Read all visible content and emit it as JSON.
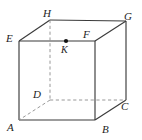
{
  "figure": {
    "type": "geometry-diagram",
    "shape": "cube",
    "width": 142,
    "height": 140,
    "background_color": "#ffffff",
    "solid_edge_color": "#3b3b3b",
    "hidden_edge_color": "#8c8c8c",
    "label_color": "#1d1d1d",
    "point_color": "#111111"
  },
  "vertices": [
    {
      "id": "A",
      "label": "A",
      "x": 19,
      "y": 120,
      "label_x": 7,
      "label_y": 122,
      "hidden": false
    },
    {
      "id": "B",
      "label": "B",
      "x": 95,
      "y": 120,
      "label_x": 102,
      "label_y": 124,
      "hidden": false
    },
    {
      "id": "C",
      "label": "C",
      "x": 126,
      "y": 100,
      "label_x": 121,
      "label_y": 101,
      "hidden": false
    },
    {
      "id": "D",
      "label": "D",
      "x": 50,
      "y": 100,
      "label_x": 33,
      "label_y": 89,
      "hidden": true
    },
    {
      "id": "E",
      "label": "E",
      "x": 19,
      "y": 41,
      "label_x": 6,
      "label_y": 33,
      "hidden": false
    },
    {
      "id": "F",
      "label": "F",
      "x": 95,
      "y": 41,
      "label_x": 83,
      "label_y": 29,
      "hidden": false
    },
    {
      "id": "G",
      "label": "G",
      "x": 126,
      "y": 21,
      "label_x": 124,
      "label_y": 11,
      "hidden": false
    },
    {
      "id": "H",
      "label": "H",
      "x": 50,
      "y": 20,
      "label_x": 43,
      "label_y": 8,
      "hidden": false
    }
  ],
  "marked_points": [
    {
      "id": "K",
      "label": "K",
      "x": 66,
      "y": 41,
      "radius": 2.1,
      "label_x": 61,
      "label_y": 45,
      "on_edge": "EF"
    }
  ],
  "edges": {
    "solid": [
      {
        "from": "A",
        "to": "B"
      },
      {
        "from": "B",
        "to": "F"
      },
      {
        "from": "F",
        "to": "E"
      },
      {
        "from": "E",
        "to": "A"
      },
      {
        "from": "E",
        "to": "H"
      },
      {
        "from": "F",
        "to": "G"
      },
      {
        "from": "H",
        "to": "G"
      },
      {
        "from": "G",
        "to": "C"
      },
      {
        "from": "B",
        "to": "C"
      }
    ],
    "dashed": [
      {
        "from": "H",
        "to": "D"
      },
      {
        "from": "D",
        "to": "A"
      },
      {
        "from": "D",
        "to": "C"
      }
    ]
  }
}
